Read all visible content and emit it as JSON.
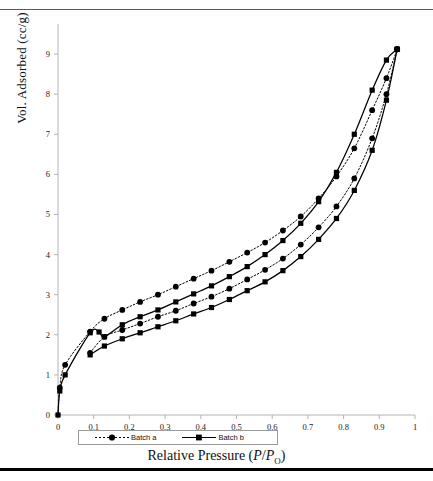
{
  "figure": {
    "top_fragment_text": "",
    "rules": {
      "top_color": "#5a5a5a",
      "bottom_color": "#000000"
    }
  },
  "axes": {
    "ylabel": "Vol. Adsorbed (cc/g)",
    "xlabel_prefix": "Relative Pressure (",
    "xlabel_p1": "P",
    "xlabel_slash": "/",
    "xlabel_p2": "P",
    "xlabel_sub": "O",
    "xlabel_suffix": ")",
    "yticks": [
      "0",
      "1",
      "2",
      "3",
      "4",
      "5",
      "6",
      "7",
      "8",
      "9"
    ],
    "xticks": [
      "0",
      "0.1",
      "0.2",
      "0.3",
      "0.4",
      "0.5",
      "0.6",
      "0.7",
      "0.8",
      "0.9",
      "1"
    ]
  },
  "legend": {
    "items": [
      {
        "label": "Batch a",
        "marker": "circle",
        "line": "dotted",
        "color": "#000000"
      },
      {
        "label": "Batch b",
        "marker": "square",
        "line": "solid",
        "color": "#000000"
      }
    ]
  },
  "chart_data": {
    "type": "line",
    "title": "",
    "subtitle": "",
    "xlabel": "Relative Pressure (P/PO)",
    "ylabel": "Vol. Adsorbed (cc/g)",
    "xlim": [
      0,
      1
    ],
    "ylim": [
      0,
      9.6
    ],
    "xticks": [
      0,
      0.1,
      0.2,
      0.3,
      0.4,
      0.5,
      0.6,
      0.7,
      0.8,
      0.9,
      1
    ],
    "yticks": [
      0,
      1,
      2,
      3,
      4,
      5,
      6,
      7,
      8,
      9
    ],
    "grid": false,
    "legend_position": "bottom-left",
    "series": [
      {
        "name": "Batch a adsorption",
        "marker": "circle",
        "line": "dotted",
        "x": [
          0,
          0.005,
          0.02,
          0.09,
          0.13,
          0.18,
          0.23,
          0.28,
          0.33,
          0.38,
          0.43,
          0.48,
          0.53,
          0.58,
          0.63,
          0.68,
          0.73,
          0.78,
          0.83,
          0.88,
          0.92,
          0.95
        ],
        "y": [
          0,
          0.68,
          1.25,
          2.08,
          2.4,
          2.62,
          2.82,
          3.0,
          3.2,
          3.4,
          3.6,
          3.82,
          4.05,
          4.3,
          4.6,
          4.95,
          5.4,
          5.95,
          6.65,
          7.6,
          8.4,
          9.12
        ]
      },
      {
        "name": "Batch a desorption",
        "marker": "circle",
        "line": "dotted",
        "x": [
          0.09,
          0.13,
          0.18,
          0.23,
          0.28,
          0.33,
          0.38,
          0.43,
          0.48,
          0.53,
          0.58,
          0.63,
          0.68,
          0.73,
          0.78,
          0.83,
          0.88,
          0.92,
          0.95
        ],
        "y": [
          1.55,
          1.95,
          2.12,
          2.28,
          2.45,
          2.6,
          2.78,
          2.95,
          3.15,
          3.38,
          3.62,
          3.9,
          4.25,
          4.68,
          5.2,
          5.9,
          6.9,
          8.0,
          9.12
        ]
      },
      {
        "name": "Batch b adsorption",
        "marker": "square",
        "line": "solid",
        "x": [
          0,
          0.005,
          0.02,
          0.09,
          0.115,
          0.13,
          0.18,
          0.23,
          0.28,
          0.33,
          0.38,
          0.43,
          0.48,
          0.53,
          0.58,
          0.63,
          0.68,
          0.73,
          0.78,
          0.83,
          0.88,
          0.92,
          0.95
        ],
        "y": [
          0,
          0.6,
          1.0,
          2.05,
          2.07,
          1.95,
          2.25,
          2.45,
          2.62,
          2.82,
          3.02,
          3.22,
          3.45,
          3.7,
          4.0,
          4.35,
          4.78,
          5.32,
          6.05,
          7.0,
          8.1,
          8.85,
          9.12
        ]
      },
      {
        "name": "Batch b desorption",
        "marker": "square",
        "line": "solid",
        "x": [
          0.09,
          0.13,
          0.18,
          0.23,
          0.28,
          0.33,
          0.38,
          0.43,
          0.48,
          0.53,
          0.58,
          0.63,
          0.68,
          0.73,
          0.78,
          0.83,
          0.88,
          0.92,
          0.95
        ],
        "y": [
          1.5,
          1.72,
          1.9,
          2.05,
          2.2,
          2.35,
          2.52,
          2.68,
          2.88,
          3.1,
          3.32,
          3.6,
          3.95,
          4.38,
          4.9,
          5.6,
          6.6,
          7.85,
          9.12
        ]
      }
    ]
  }
}
